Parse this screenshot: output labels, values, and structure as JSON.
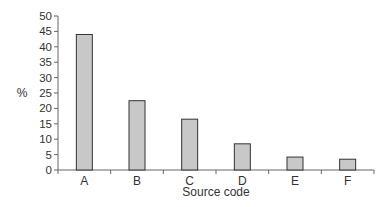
{
  "chart_data": {
    "type": "bar",
    "title": "",
    "xlabel": "Source code",
    "ylabel": "%",
    "categories": [
      "A",
      "B",
      "C",
      "D",
      "E",
      "F"
    ],
    "values": [
      44,
      22.5,
      16.5,
      8.5,
      4.2,
      3.5
    ],
    "ylim": [
      0,
      50
    ],
    "yticks": [
      0,
      5,
      10,
      15,
      20,
      25,
      30,
      35,
      40,
      45,
      50
    ],
    "grid": false,
    "legend": null,
    "bar_color": "#c8c8c8",
    "bar_edge_color": "#333333"
  }
}
